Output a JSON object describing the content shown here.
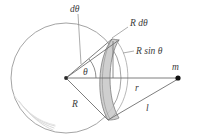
{
  "figure": {
    "kind": "physics-geometry-diagram",
    "labels": {
      "dtheta": "dθ",
      "r_dtheta": "R  dθ",
      "r_sin_theta": "R  sin θ",
      "theta": "θ",
      "radius": "R",
      "distance_r": "r",
      "distance_l": "l",
      "mass": "m"
    },
    "colors": {
      "stroke": "#6f6f6f",
      "outline": "#8a8a8a",
      "band_fill": "#c9c9c9",
      "band_stroke": "#7a7a7a",
      "text": "#3b3b3b",
      "point": "#1a1a1a",
      "shade": "#d8d8d8",
      "background": "#ffffff"
    },
    "geometry": {
      "center": [
        66,
        78
      ],
      "sphere_radius": 55,
      "mass_point": [
        178,
        78
      ],
      "ring_top": [
        112,
        39
      ],
      "ring_bottom": [
        108,
        120
      ]
    }
  }
}
